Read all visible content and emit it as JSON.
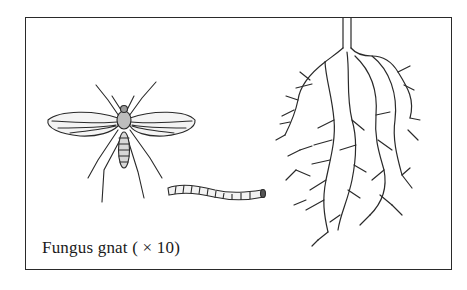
{
  "figure": {
    "caption": "Fungus gnat ( × 10)",
    "elements": [
      {
        "name": "adult-fungus-gnat",
        "description": "Winged adult gnat, dorsal view"
      },
      {
        "name": "larva",
        "description": "Segmented worm-like larva"
      },
      {
        "name": "plant-roots",
        "description": "Branching root system damaged by larvae"
      }
    ],
    "colors": {
      "ink": "#2a2a2a",
      "background": "#ffffff",
      "shade": "#cfcfcf"
    }
  }
}
